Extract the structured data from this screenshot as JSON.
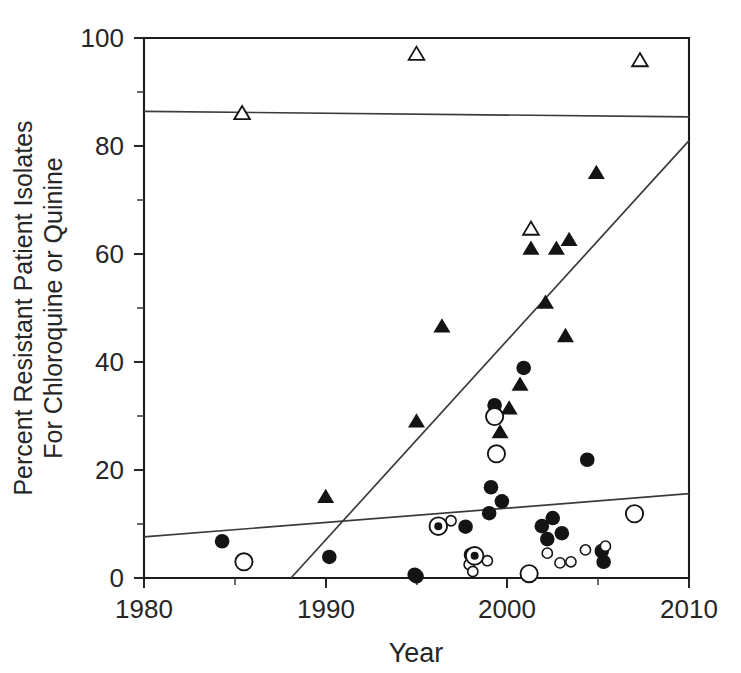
{
  "chart_data": {
    "type": "scatter",
    "title": "",
    "xlabel": "Year",
    "ylabel": "Percent Resistant Patient Isolates For Chloroquine or Quinine",
    "ylabel_lines": [
      "Percent Resistant Patient Isolates",
      "For Chloroquine or Quinine"
    ],
    "xlim": [
      1980,
      2010
    ],
    "ylim": [
      0,
      100
    ],
    "xticks": [
      1980,
      1990,
      2000,
      2010
    ],
    "xtick_labels": [
      "1980",
      "1990",
      "2000",
      "2010"
    ],
    "xticks_minor": [
      1985,
      1995,
      2005
    ],
    "yticks": [
      0,
      20,
      40,
      60,
      80,
      100
    ],
    "ytick_labels": [
      "0",
      "20",
      "40",
      "60",
      "80",
      "100"
    ],
    "yticks_minor": [
      10,
      30,
      50,
      70,
      90
    ],
    "grid": false,
    "legend": "none",
    "series": [
      {
        "name": "Open triangles (high chloroquine resistance)",
        "marker": "triangle-open",
        "points": [
          {
            "x": 1985.4,
            "y": 86.0
          },
          {
            "x": 1995.0,
            "y": 97.0
          },
          {
            "x": 2001.3,
            "y": 64.6
          },
          {
            "x": 2007.3,
            "y": 95.8
          }
        ]
      },
      {
        "name": "Filled triangles (chloroquine resistance)",
        "marker": "triangle-filled",
        "points": [
          {
            "x": 1990.0,
            "y": 15.0
          },
          {
            "x": 1995.0,
            "y": 29.0
          },
          {
            "x": 1996.4,
            "y": 46.6
          },
          {
            "x": 1999.6,
            "y": 27.0
          },
          {
            "x": 2000.1,
            "y": 31.4
          },
          {
            "x": 2000.7,
            "y": 35.8
          },
          {
            "x": 2001.3,
            "y": 61.0
          },
          {
            "x": 2002.1,
            "y": 51.0
          },
          {
            "x": 2002.7,
            "y": 61.0
          },
          {
            "x": 2003.2,
            "y": 44.8
          },
          {
            "x": 2003.4,
            "y": 62.6
          },
          {
            "x": 2004.9,
            "y": 75.0
          }
        ]
      },
      {
        "name": "Filled circles (quinine resistance)",
        "marker": "circle-filled",
        "points": [
          {
            "x": 1984.3,
            "y": 6.8
          },
          {
            "x": 1990.2,
            "y": 3.9
          },
          {
            "x": 1994.9,
            "y": 0.6
          },
          {
            "x": 1995.0,
            "y": 0.3
          },
          {
            "x": 1997.7,
            "y": 9.5
          },
          {
            "x": 1998.0,
            "y": 4.3
          },
          {
            "x": 1999.0,
            "y": 12.0
          },
          {
            "x": 1999.1,
            "y": 16.8
          },
          {
            "x": 1999.3,
            "y": 32.0
          },
          {
            "x": 1999.7,
            "y": 14.2
          },
          {
            "x": 2000.9,
            "y": 38.9
          },
          {
            "x": 2001.9,
            "y": 9.6
          },
          {
            "x": 2002.2,
            "y": 7.2
          },
          {
            "x": 2002.5,
            "y": 11.1
          },
          {
            "x": 2003.0,
            "y": 8.3
          },
          {
            "x": 2004.4,
            "y": 21.9
          },
          {
            "x": 2005.2,
            "y": 5.0
          },
          {
            "x": 2005.3,
            "y": 3.0
          }
        ]
      },
      {
        "name": "Large open circles",
        "marker": "circle-open",
        "points": [
          {
            "x": 1985.5,
            "y": 3.0
          },
          {
            "x": 1999.3,
            "y": 29.9
          },
          {
            "x": 1999.4,
            "y": 23.0
          },
          {
            "x": 2001.2,
            "y": 0.8
          },
          {
            "x": 2007.0,
            "y": 11.9
          }
        ]
      },
      {
        "name": "Small open circles",
        "marker": "circle-open-small",
        "points": [
          {
            "x": 1996.9,
            "y": 10.6
          },
          {
            "x": 1997.9,
            "y": 2.5
          },
          {
            "x": 1998.1,
            "y": 1.2
          },
          {
            "x": 1998.9,
            "y": 3.2
          },
          {
            "x": 2002.2,
            "y": 4.6
          },
          {
            "x": 2002.9,
            "y": 2.8
          },
          {
            "x": 2003.5,
            "y": 3.0
          },
          {
            "x": 2004.3,
            "y": 5.2
          },
          {
            "x": 2005.4,
            "y": 5.9
          }
        ]
      },
      {
        "name": "Bullseye markers (filled circle in open circle)",
        "marker": "circle-bullseye",
        "points": [
          {
            "x": 1996.2,
            "y": 9.6
          },
          {
            "x": 1998.2,
            "y": 4.1
          }
        ]
      }
    ],
    "fit_lines": [
      {
        "name": "Upper flat trend (open triangles)",
        "x1": 1980,
        "y1": 86.4,
        "x2": 2010,
        "y2": 85.4
      },
      {
        "name": "Steep rising trend (chloroquine)",
        "x1": 1988.1,
        "y1": 0.0,
        "x2": 2010,
        "y2": 81.0
      },
      {
        "name": "Shallow rising trend (quinine)",
        "x1": 1980,
        "y1": 7.6,
        "x2": 2010,
        "y2": 15.6
      }
    ]
  }
}
